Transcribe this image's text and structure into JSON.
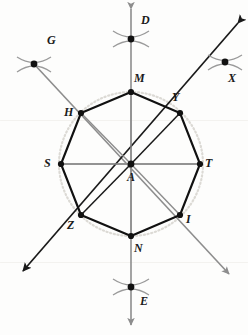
{
  "figure": {
    "center": {
      "name": "A",
      "x": 131,
      "y": 164,
      "label_x": 127,
      "label_y": 172
    },
    "circle": {
      "cx": 131,
      "cy": 164,
      "r": 72,
      "style": "dotted",
      "color": "#d9d7d2"
    },
    "polygon": {
      "sides": 8,
      "type": "regular-octagon",
      "stroke": "#111111",
      "stroke_width": 2,
      "vertices": [
        {
          "name": "M",
          "x": 131,
          "y": 92,
          "label_x": 134,
          "label_y": 76
        },
        {
          "name": "Y",
          "x": 180,
          "y": 113,
          "label_x": 172,
          "label_y": 94
        },
        {
          "name": "T",
          "x": 200,
          "y": 164,
          "label_x": 205,
          "label_y": 158
        },
        {
          "name": "I",
          "x": 180,
          "y": 215,
          "label_x": 185,
          "label_y": 214
        },
        {
          "name": "N",
          "x": 131,
          "y": 236,
          "label_x": 134,
          "label_y": 242
        },
        {
          "name": "Z",
          "x": 81,
          "y": 215,
          "label_x": 68,
          "label_y": 220
        },
        {
          "name": "S",
          "x": 61,
          "y": 164,
          "label_x": 44,
          "label_y": 158
        },
        {
          "name": "H",
          "x": 81,
          "y": 113,
          "label_x": 64,
          "label_y": 107
        }
      ]
    },
    "construction_lines": [
      {
        "name": "vertical-axis-DE",
        "x1": 131,
        "y1": 3,
        "x2": 131,
        "y2": 331,
        "color": "#8d8d8d",
        "width": 1.6,
        "arrow_start": true,
        "arrow_end": true
      },
      {
        "name": "horizontal-axis-ST",
        "x1": 61,
        "y1": 164,
        "x2": 200,
        "y2": 164,
        "color": "#8d8d8d",
        "width": 1.6,
        "arrow_start": false,
        "arrow_end": false
      },
      {
        "name": "diagonal-ray-HI",
        "x1": 34,
        "y1": 64,
        "x2": 235,
        "y2": 280,
        "color": "#8d8d8d",
        "width": 1.6,
        "arrow_start": false,
        "arrow_end": true
      },
      {
        "name": "diagonal-ray-GX",
        "x1": 243,
        "y1": 18,
        "x2": 18,
        "y2": 277,
        "color": "#1a1a1a",
        "width": 1.8,
        "arrow_start": true,
        "arrow_end": true
      }
    ],
    "arc_points": [
      {
        "name": "D",
        "x": 131,
        "y": 39,
        "label_x": 141,
        "label_y": 21,
        "arc_angle": -38
      },
      {
        "name": "G",
        "x": 34,
        "y": 64,
        "label_x": 47,
        "label_y": 41,
        "arc_angle": 8
      },
      {
        "name": "X",
        "x": 225,
        "y": 62,
        "label_x": 229,
        "label_y": 72,
        "arc_angle": -8
      },
      {
        "name": "E",
        "x": 131,
        "y": 287,
        "label_x": 140,
        "label_y": 297,
        "arc_angle": -38
      }
    ],
    "arrow_heads": [
      {
        "name": "arrow-up-D",
        "x": 131,
        "y": 3,
        "dir": "up"
      },
      {
        "name": "arrow-down-E",
        "x": 131,
        "y": 331,
        "dir": "down"
      },
      {
        "name": "arrow-upleft-G",
        "x": 12,
        "y": 41,
        "dir": "upleft"
      },
      {
        "name": "arrow-upright-X",
        "x": 243,
        "y": 18,
        "dir": "upright"
      },
      {
        "name": "arrow-downleft-Z",
        "x": 18,
        "y": 277,
        "dir": "downleft"
      },
      {
        "name": "arrow-downright-I",
        "x": 235,
        "y": 280,
        "dir": "downright"
      }
    ],
    "labels": {
      "center": "A",
      "vertices": [
        "M",
        "Y",
        "T",
        "I",
        "N",
        "Z",
        "S",
        "H"
      ],
      "exterior": [
        "D",
        "G",
        "X",
        "E"
      ]
    }
  }
}
